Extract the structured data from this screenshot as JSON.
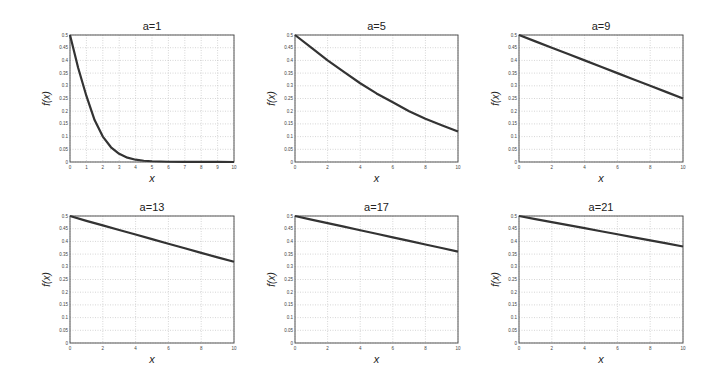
{
  "figure": {
    "xlabel": "x",
    "ylabel": "f(x)",
    "colors": {
      "curve": "#333333",
      "axes": "#555555",
      "grid": "#bbbbbb",
      "background": "#ffffff"
    }
  },
  "chart_data": [
    {
      "type": "line",
      "title": "a=1",
      "xlabel": "x",
      "ylabel": "f(x)",
      "xlim": [
        0,
        10
      ],
      "ylim": [
        0,
        0.5
      ],
      "xticks": [
        0,
        1,
        2,
        3,
        4,
        5,
        6,
        7,
        8,
        9,
        10
      ],
      "yticks": [
        0,
        0.05,
        0.1,
        0.15,
        0.2,
        0.25,
        0.3,
        0.35,
        0.4,
        0.45,
        0.5
      ],
      "grid": true,
      "x": [
        0,
        0.5,
        1,
        1.5,
        2,
        2.5,
        3,
        3.5,
        4,
        4.5,
        5,
        6,
        7,
        8,
        9,
        10
      ],
      "y": [
        0.5,
        0.37,
        0.26,
        0.165,
        0.1,
        0.058,
        0.032,
        0.017,
        0.009,
        0.005,
        0.003,
        0.001,
        0.0005,
        0.0002,
        0.0001,
        0
      ]
    },
    {
      "type": "line",
      "title": "a=5",
      "xlabel": "x",
      "ylabel": "f(x)",
      "xlim": [
        0,
        10
      ],
      "ylim": [
        0,
        0.5
      ],
      "xticks": [
        0,
        2,
        4,
        6,
        8,
        10
      ],
      "yticks": [
        0,
        0.05,
        0.1,
        0.15,
        0.2,
        0.25,
        0.3,
        0.35,
        0.4,
        0.45,
        0.5
      ],
      "grid": true,
      "x": [
        0,
        1,
        2,
        3,
        4,
        5,
        6,
        7,
        8,
        9,
        10
      ],
      "y": [
        0.5,
        0.45,
        0.4,
        0.355,
        0.31,
        0.27,
        0.235,
        0.2,
        0.17,
        0.145,
        0.12
      ]
    },
    {
      "type": "line",
      "title": "a=9",
      "xlabel": "x",
      "ylabel": "f(x)",
      "xlim": [
        0,
        10
      ],
      "ylim": [
        0,
        0.5
      ],
      "xticks": [
        0,
        2,
        4,
        6,
        8,
        10
      ],
      "yticks": [
        0,
        0.05,
        0.1,
        0.15,
        0.2,
        0.25,
        0.3,
        0.35,
        0.4,
        0.45,
        0.5
      ],
      "grid": true,
      "x": [
        0,
        1,
        2,
        3,
        4,
        5,
        6,
        7,
        8,
        9,
        10
      ],
      "y": [
        0.5,
        0.475,
        0.45,
        0.425,
        0.4,
        0.375,
        0.35,
        0.325,
        0.3,
        0.275,
        0.25
      ]
    },
    {
      "type": "line",
      "title": "a=13",
      "xlabel": "x",
      "ylabel": "f(x)",
      "xlim": [
        0,
        10
      ],
      "ylim": [
        0,
        0.5
      ],
      "xticks": [
        0,
        2,
        4,
        6,
        8,
        10
      ],
      "yticks": [
        0,
        0.05,
        0.1,
        0.15,
        0.2,
        0.25,
        0.3,
        0.35,
        0.4,
        0.45,
        0.5
      ],
      "grid": true,
      "x": [
        0,
        1,
        2,
        3,
        4,
        5,
        6,
        7,
        8,
        9,
        10
      ],
      "y": [
        0.5,
        0.481,
        0.463,
        0.445,
        0.427,
        0.409,
        0.391,
        0.373,
        0.355,
        0.337,
        0.32
      ]
    },
    {
      "type": "line",
      "title": "a=17",
      "xlabel": "x",
      "ylabel": "f(x)",
      "xlim": [
        0,
        10
      ],
      "ylim": [
        0,
        0.5
      ],
      "xticks": [
        0,
        2,
        4,
        6,
        8,
        10
      ],
      "yticks": [
        0,
        0.05,
        0.1,
        0.15,
        0.2,
        0.25,
        0.3,
        0.35,
        0.4,
        0.45,
        0.5
      ],
      "grid": true,
      "x": [
        0,
        1,
        2,
        3,
        4,
        5,
        6,
        7,
        8,
        9,
        10
      ],
      "y": [
        0.5,
        0.486,
        0.472,
        0.458,
        0.444,
        0.43,
        0.416,
        0.402,
        0.388,
        0.374,
        0.36
      ]
    },
    {
      "type": "line",
      "title": "a=21",
      "xlabel": "x",
      "ylabel": "f(x)",
      "xlim": [
        0,
        10
      ],
      "ylim": [
        0,
        0.5
      ],
      "xticks": [
        0,
        2,
        4,
        6,
        8,
        10
      ],
      "yticks": [
        0,
        0.05,
        0.1,
        0.15,
        0.2,
        0.25,
        0.3,
        0.35,
        0.4,
        0.45,
        0.5
      ],
      "grid": true,
      "x": [
        0,
        1,
        2,
        3,
        4,
        5,
        6,
        7,
        8,
        9,
        10
      ],
      "y": [
        0.5,
        0.488,
        0.476,
        0.464,
        0.452,
        0.44,
        0.428,
        0.416,
        0.404,
        0.392,
        0.38
      ]
    }
  ],
  "layout": {
    "panels": [
      {
        "left": 70,
        "top": 35,
        "width": 164,
        "height": 127
      },
      {
        "left": 295,
        "top": 35,
        "width": 163,
        "height": 127
      },
      {
        "left": 519,
        "top": 35,
        "width": 164,
        "height": 127
      },
      {
        "left": 70,
        "top": 216,
        "width": 164,
        "height": 127
      },
      {
        "left": 295,
        "top": 216,
        "width": 163,
        "height": 127
      },
      {
        "left": 519,
        "top": 216,
        "width": 164,
        "height": 127
      }
    ]
  }
}
